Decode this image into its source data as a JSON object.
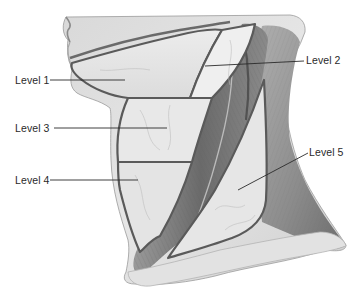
{
  "figure": {
    "colors": {
      "background": "#ffffff",
      "skin_light": "#e4e4e4",
      "skin_mid": "#c9c9c9",
      "muscle_dark": "#6e6e6e",
      "muscle_mid": "#8d8d8d",
      "outline": "#5a5a5a",
      "leader_line": "#2a2a2a",
      "label_text": "#2a2a2a"
    },
    "labels": [
      {
        "id": "level-1",
        "text": "Level 1",
        "side": "left"
      },
      {
        "id": "level-2",
        "text": "Level 2",
        "side": "right"
      },
      {
        "id": "level-3",
        "text": "Level 3",
        "side": "left"
      },
      {
        "id": "level-4",
        "text": "Level 4",
        "side": "left"
      },
      {
        "id": "level-5",
        "text": "Level 5",
        "side": "right"
      }
    ]
  }
}
